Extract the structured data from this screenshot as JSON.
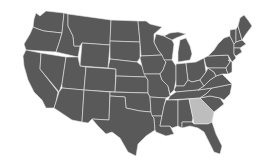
{
  "map": {
    "title": "United States",
    "colors": {
      "background": "#ffffff",
      "state_fill": "#595959",
      "highlight_fill": "#bdbdbd",
      "border": "#e8e8e8"
    },
    "highlighted_states": [
      "Georgia"
    ]
  }
}
